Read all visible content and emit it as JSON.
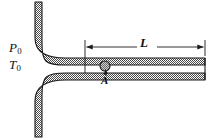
{
  "figure": {
    "type": "engineering-schematic",
    "width": 218,
    "height": 139,
    "background_color": "#ffffff"
  },
  "labels": {
    "stagnation_pressure": {
      "symbol": "P",
      "subscript": "0",
      "text": "P0"
    },
    "stagnation_temperature": {
      "symbol": "T",
      "subscript": "0",
      "text": "T0"
    },
    "duct_length": {
      "symbol": "L",
      "text": "L"
    },
    "station_a": {
      "symbol": "A",
      "text": "A"
    }
  },
  "dimension": {
    "name": "duct-length-dimension",
    "label": "L",
    "start_x": 85,
    "end_x": 205,
    "y": 47,
    "arrowheads": "both"
  },
  "geometry": {
    "wall_thickness": 7,
    "duct_top_y": 58,
    "duct_bottom_y": 80,
    "duct_inner_top_y": 65,
    "duct_inner_bottom_y": 73,
    "duct_left_x": 85,
    "duct_right_x": 205,
    "inlet_curve_radius": 34,
    "marker_circle": {
      "cx": 105,
      "cy": 66,
      "r": 5
    }
  },
  "colors": {
    "stroke": "#1a1a1a",
    "wall_fill": "#b9b9b9",
    "marker_fill": "#9a9a9a",
    "background": "#ffffff"
  }
}
